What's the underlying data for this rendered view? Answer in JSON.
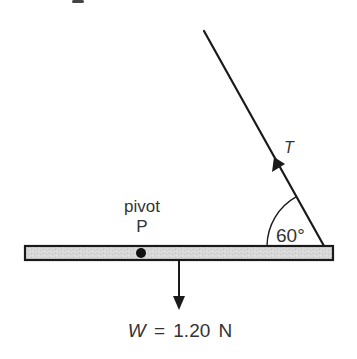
{
  "figure": {
    "partial_top_text": "g",
    "colors": {
      "stroke": "#1a1a1a",
      "bar_fill": "#d9d9d9",
      "bar_speckle": "#bdbdbd",
      "text": "#333333",
      "background": "#ffffff"
    },
    "bar": {
      "x1": 25,
      "x2": 333,
      "y_top": 246,
      "y_bottom": 260
    },
    "pivot": {
      "label_word": "pivot",
      "label_letter": "P",
      "x": 141,
      "y": 253,
      "radius": 5
    },
    "tension": {
      "label": "T",
      "string_top": {
        "x": 204,
        "y": 31
      },
      "string_bottom": {
        "x": 324,
        "y": 246
      },
      "arrow_tip": {
        "x": 275,
        "y": 158
      }
    },
    "angle": {
      "label": "60°",
      "value_degrees": 60,
      "arc_radius": 57
    },
    "weight": {
      "symbol": "W",
      "equals": "=",
      "value": "1.20",
      "unit": "N",
      "x": 179,
      "y_start": 260,
      "y_tip": 309
    }
  }
}
